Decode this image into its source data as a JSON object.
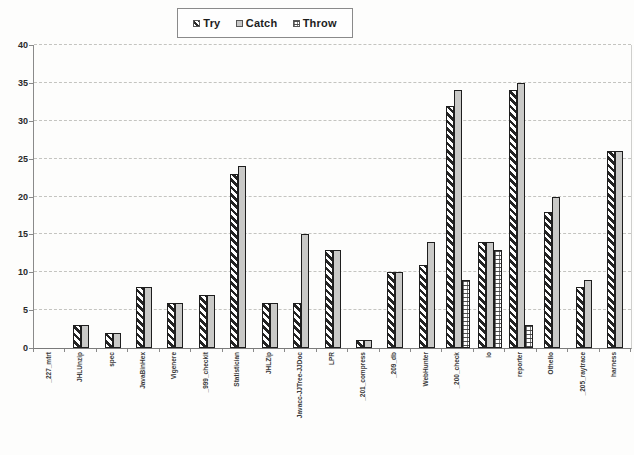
{
  "chart_data": {
    "type": "bar",
    "title": "",
    "xlabel": "",
    "ylabel": "",
    "ylim": [
      0,
      40
    ],
    "ytick_step": 5,
    "grid": "horizontal-dashed",
    "legend_position": "top-center",
    "categories": [
      "_227_mtrt",
      "JHLUnzip",
      "spec",
      "JavaBinHex",
      "Vigenere",
      "_999_checkit",
      "Statistician",
      "JHLZip",
      "Javacc-JJTree-JJDoc",
      "LPR",
      "_201_compress",
      "_209_db",
      "WebHunter",
      "_200_check",
      "io",
      "reporter",
      "Othello",
      "_205_raytrace",
      "harness"
    ],
    "series": [
      {
        "name": "Try",
        "pattern": "diagonal-hatch",
        "values": [
          0,
          3,
          2,
          8,
          6,
          7,
          23,
          6,
          6,
          13,
          1,
          10,
          11,
          32,
          14,
          34,
          18,
          8,
          26
        ]
      },
      {
        "name": "Catch",
        "pattern": "gray-solid",
        "values": [
          0,
          3,
          2,
          8,
          6,
          7,
          24,
          6,
          15,
          13,
          1,
          10,
          14,
          34,
          14,
          35,
          20,
          9,
          26
        ]
      },
      {
        "name": "Throw",
        "pattern": "brick",
        "values": [
          0,
          0,
          0,
          0,
          0,
          0,
          0,
          0,
          0,
          0,
          0,
          0,
          0,
          9,
          13,
          3,
          0,
          0,
          0
        ]
      }
    ]
  },
  "legend": {
    "items": [
      {
        "label": "Try",
        "pattern": "diagonal-hatch"
      },
      {
        "label": "Catch",
        "pattern": "gray-solid"
      },
      {
        "label": "Throw",
        "pattern": "brick"
      }
    ]
  },
  "colors": {
    "catch_fill": "#c9c9c7",
    "hatch_ink": "#242424",
    "axis": "#8a8a8a",
    "gridline": "#c4c4c0",
    "text": "#2a2a2a",
    "background": "#fdfdfc"
  }
}
